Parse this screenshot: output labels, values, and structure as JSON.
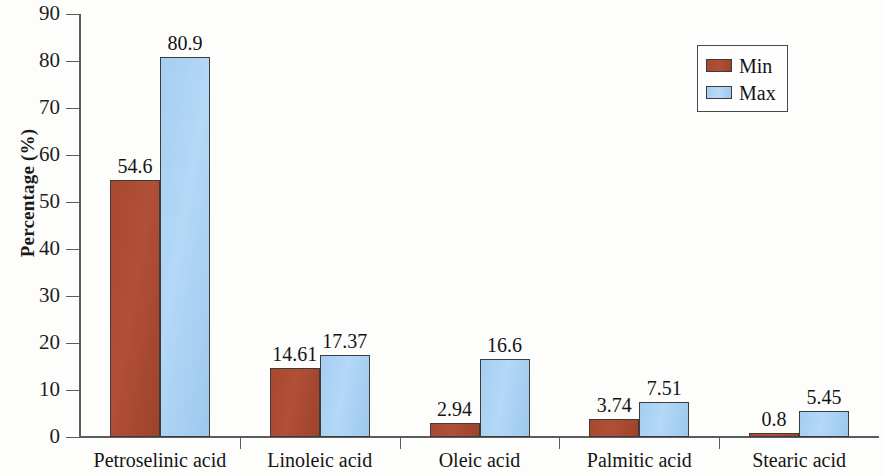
{
  "chart_data": {
    "type": "bar",
    "title": "",
    "subtitle": "",
    "xlabel": "",
    "ylabel": "Percentage (%)",
    "categories": [
      "Petroselinic acid",
      "Linoleic acid",
      "Oleic acid",
      "Palmitic acid",
      "Stearic acid"
    ],
    "series": [
      {
        "name": "Min",
        "color": "#a8492f",
        "values": [
          54.6,
          14.61,
          2.94,
          3.74,
          0.8
        ]
      },
      {
        "name": "Max",
        "color": "#a6cef1",
        "values": [
          80.9,
          17.37,
          16.6,
          7.51,
          5.45
        ]
      }
    ],
    "value_labels": {
      "Min": [
        "54.6",
        "14.61",
        "2.94",
        "3.74",
        "0.8"
      ],
      "Max": [
        "80.9",
        "17.37",
        "16.6",
        "7.51",
        "5.45"
      ]
    },
    "ylim": [
      0,
      90
    ],
    "yticks": [
      0,
      10,
      20,
      30,
      40,
      50,
      60,
      70,
      80,
      90
    ],
    "ytick_labels": [
      "0",
      "10",
      "20",
      "30",
      "40",
      "50",
      "60",
      "70",
      "80",
      "90"
    ],
    "grid": false,
    "legend_position": "top-right",
    "legend_entries": [
      "Min",
      "Max"
    ],
    "show_data_labels": true
  },
  "axis": {
    "y_title": "Percentage (%)",
    "y_tick_labels": [
      "90",
      "80",
      "70",
      "60",
      "50",
      "40",
      "30",
      "20",
      "10",
      "0"
    ]
  },
  "legend": {
    "entries": [
      {
        "label": "Min",
        "swatch": "min-swatch"
      },
      {
        "label": "Max",
        "swatch": "max-swatch"
      }
    ]
  },
  "categories": [
    {
      "label": "Petroselinic acid",
      "min": "54.6",
      "max": "80.9"
    },
    {
      "label": "Linoleic acid",
      "min": "14.61",
      "max": "17.37"
    },
    {
      "label": "Oleic acid",
      "min": "2.94",
      "max": "16.6"
    },
    {
      "label": "Palmitic acid",
      "min": "3.74",
      "max": "7.51"
    },
    {
      "label": "Stearic acid",
      "min": "0.8",
      "max": "5.45"
    }
  ]
}
